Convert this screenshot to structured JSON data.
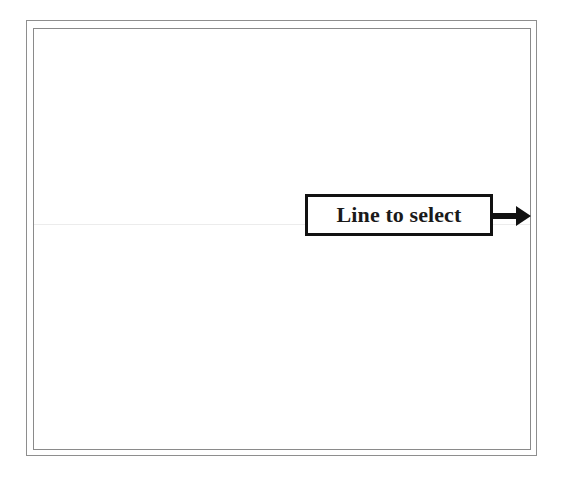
{
  "figure": {
    "background_color": "#ffffff",
    "frame": {
      "name": "double-ruled-border",
      "outer_color": "#8e8e8e",
      "inner_color": "#8a8a8a",
      "style": "double"
    },
    "canvas": {
      "fill_color": "#ffffff"
    },
    "target_line": {
      "description": "faint horizontal rule",
      "color": "#ececec",
      "orientation": "horizontal"
    },
    "callout": {
      "label": "Line to select",
      "border_color": "#111111",
      "fill_color": "#ffffff",
      "text_color": "#1a1a1a",
      "arrow": {
        "name": "arrow-right-icon",
        "color": "#111111",
        "direction": "right"
      }
    }
  }
}
